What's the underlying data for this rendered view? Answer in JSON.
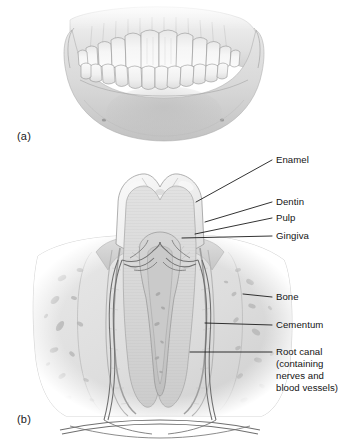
{
  "figure": {
    "style": "grayscale pencil-shaded medical illustration",
    "panels": [
      {
        "letter": "(a)",
        "name": "anterior-view-of-teeth-in-jaws",
        "description": "Frontal view of upper and lower dental arches set in the maxilla and mandible"
      },
      {
        "letter": "(b)",
        "name": "longitudinal-section-of-molar",
        "description": "Cut-away longitudinal section through a molar tooth within its bony socket"
      }
    ]
  },
  "labels": {
    "enamel": "Enamel",
    "dentin": "Dentin",
    "pulp": "Pulp",
    "gingiva": "Gingiva",
    "bone": "Bone",
    "cementum": "Cementum",
    "root_canal_line1": "Root canal",
    "root_canal_line2": "(containing",
    "root_canal_line3": "nerves and",
    "root_canal_line4": "blood vessels)"
  },
  "colors": {
    "background": "#ffffff",
    "ink": "#141414",
    "leader_line": "#1c1c1c",
    "enamel_fill": "#eeeeee",
    "dentin_fill": "#dcdcdc",
    "pulp_fill": "#cfcfcf",
    "gingiva_fill": "#d6d6d6",
    "bone_fill": "#e3e3e3",
    "bone_marrow": "#bdbdbd",
    "cementum_fill": "#d2d2d2",
    "nerve_vessel": "#7a7a7a",
    "jaw_bone": "#d9d9d9",
    "tooth_crown": "#f0f0f0"
  }
}
